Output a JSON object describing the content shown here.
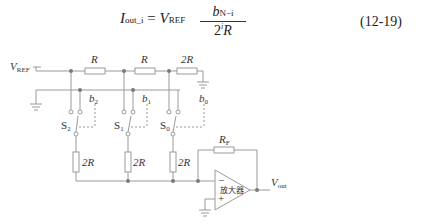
{
  "equation": {
    "lhs_symbol": "I",
    "lhs_subscript": "out_i",
    "equals": "=",
    "v_symbol": "V",
    "v_subscript": "REF",
    "numerator_symbol": "b",
    "numerator_subscript": "N−i",
    "denominator_base": "2",
    "denominator_exp": "i",
    "denominator_symbol": "R",
    "number": "(12-19)"
  },
  "circuit": {
    "vref_label": "V",
    "vref_sub": "REF",
    "resistors_top": [
      "R",
      "R",
      "2R"
    ],
    "bit_labels": [
      {
        "sym": "b",
        "sub": "2"
      },
      {
        "sym": "b",
        "sub": "1"
      },
      {
        "sym": "b",
        "sub": "0"
      }
    ],
    "switch_labels": [
      {
        "sym": "S",
        "sub": "2"
      },
      {
        "sym": "S",
        "sub": "1"
      },
      {
        "sym": "S",
        "sub": "0"
      }
    ],
    "resistors_vertical": [
      "2R",
      "2R",
      "2R"
    ],
    "feedback_label": "R",
    "feedback_sub": "F",
    "opamp_label": "放大器",
    "opamp_minus": "−",
    "opamp_plus": "+",
    "vout_label": "V",
    "vout_sub": "out",
    "line_color": "#9a9a9a",
    "dot_color": "#7a7a7a"
  }
}
